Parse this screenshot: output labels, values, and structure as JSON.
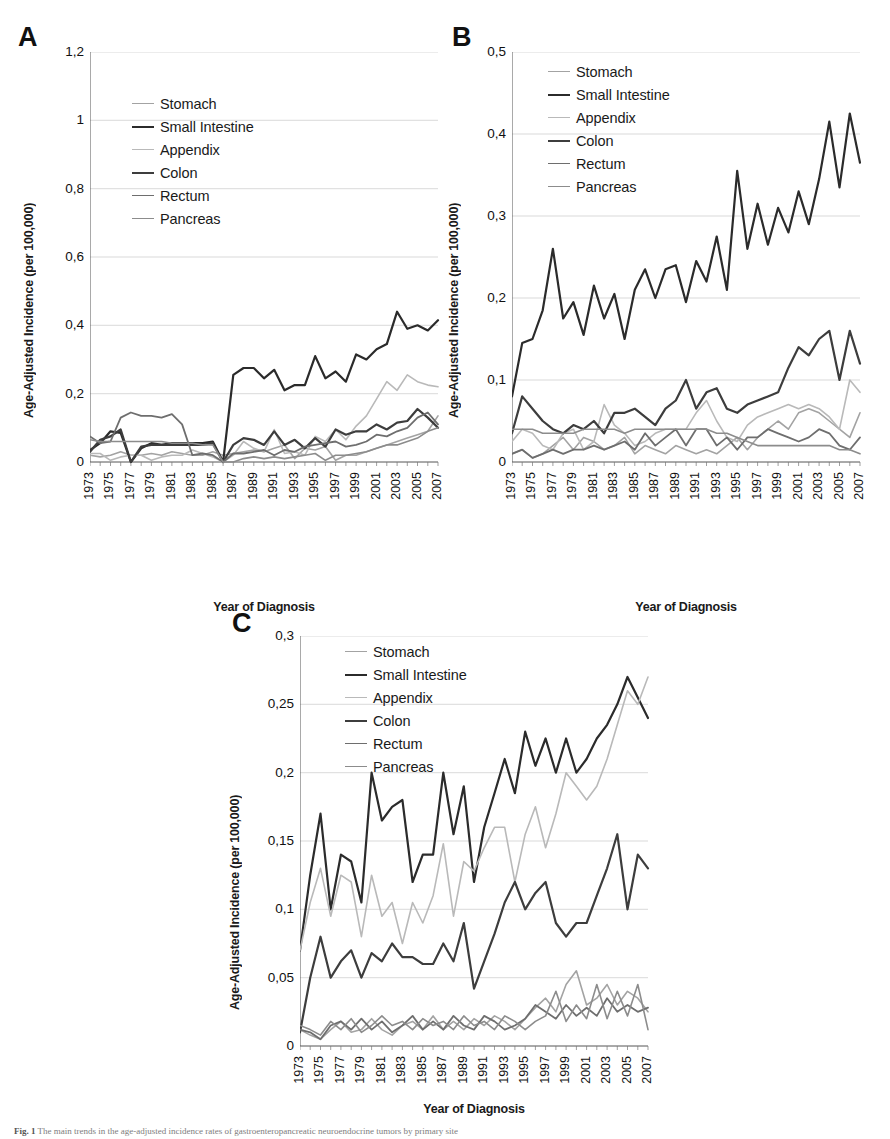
{
  "figure": {
    "caption_prefix": "Fig. 1",
    "caption_text": "The main trends in the age-adjusted incidence rates of gastroenteropancreatic neuroendocrine tumors by primary site"
  },
  "axis": {
    "ylabel": "Age-Adjusted Incidence (per 100,000)",
    "xlabel": "Year of Diagnosis"
  },
  "series_names": [
    "Stomach",
    "Small Intestine",
    "Appendix",
    "Colon",
    "Rectum",
    "Pancreas"
  ],
  "series_colors": [
    "#a3a3a3",
    "#2b2b2b",
    "#b9b9b9",
    "#3d3d3d",
    "#6e6e6e",
    "#8c8c8c"
  ],
  "series_widths": [
    1.6,
    2.2,
    1.6,
    2.2,
    1.8,
    1.6
  ],
  "panels": [
    {
      "letter": "A"
    },
    {
      "letter": "B"
    },
    {
      "letter": "C"
    }
  ],
  "chart_data": [
    {
      "type": "line",
      "panel": "A",
      "title": "",
      "xlabel": "Year of Diagnosis",
      "ylabel": "Age-Adjusted Incidence (per 100,000)",
      "xlim": [
        1973,
        2007
      ],
      "ylim": [
        0,
        1.2
      ],
      "yticks": [
        0,
        0.2,
        0.4,
        0.6,
        0.8,
        1,
        1.2
      ],
      "ytick_labels": [
        "0",
        "0,2",
        "0,4",
        "0,6",
        "0,8",
        "1",
        "1,2"
      ],
      "x": [
        1973,
        1974,
        1975,
        1976,
        1977,
        1978,
        1979,
        1980,
        1981,
        1982,
        1983,
        1984,
        1985,
        1986,
        1987,
        1988,
        1989,
        1990,
        1991,
        1992,
        1993,
        1994,
        1995,
        1996,
        1997,
        1998,
        1999,
        2000,
        2001,
        2002,
        2003,
        2004,
        2005,
        2006,
        2007
      ],
      "xtick_labels": [
        "1973",
        "1975",
        "1977",
        "1979",
        "1981",
        "1983",
        "1985",
        "1987",
        "1989",
        "1991",
        "1993",
        "1995",
        "1997",
        "1999",
        "2001",
        "2003",
        "2005",
        "2007"
      ],
      "grid": true,
      "legend_position": "upper-left",
      "series": [
        {
          "name": "Stomach",
          "values": [
            0.02,
            0.015,
            0.02,
            0.03,
            0.02,
            0.02,
            0.025,
            0.02,
            0.03,
            0.025,
            0.02,
            0.02,
            0.03,
            0.02,
            0.025,
            0.03,
            0.035,
            0.03,
            0.04,
            0.05,
            0.01,
            0.04,
            0.035,
            0.045,
            0.005,
            0.02,
            0.02,
            0.03,
            0.04,
            0.05,
            0.06,
            0.07,
            0.08,
            0.09,
            0.135
          ]
        },
        {
          "name": "Small Intestine",
          "values": [
            0.035,
            0.055,
            0.09,
            0.085,
            0.0,
            0.04,
            0.055,
            0.05,
            0.055,
            0.055,
            0.055,
            0.055,
            0.06,
            0.0,
            0.255,
            0.275,
            0.275,
            0.245,
            0.27,
            0.21,
            0.225,
            0.225,
            0.31,
            0.245,
            0.265,
            0.235,
            0.315,
            0.3,
            0.33,
            0.345,
            0.44,
            0.39,
            0.4,
            0.385,
            0.415
          ]
        },
        {
          "name": "Appendix",
          "values": [
            0.025,
            0.025,
            0.005,
            0.015,
            0.02,
            0.02,
            0.005,
            0.015,
            0.02,
            0.02,
            0.035,
            0.025,
            0.015,
            0.0,
            0.02,
            0.06,
            0.04,
            0.03,
            0.095,
            0.025,
            0.03,
            0.02,
            0.075,
            0.06,
            0.095,
            0.065,
            0.105,
            0.135,
            0.185,
            0.235,
            0.21,
            0.255,
            0.235,
            0.225,
            0.22
          ]
        },
        {
          "name": "Colon",
          "values": [
            0.03,
            0.065,
            0.075,
            0.095,
            0.0,
            0.045,
            0.05,
            0.05,
            0.05,
            0.05,
            0.05,
            0.05,
            0.055,
            0.0,
            0.05,
            0.07,
            0.065,
            0.05,
            0.09,
            0.05,
            0.065,
            0.04,
            0.07,
            0.045,
            0.095,
            0.08,
            0.09,
            0.09,
            0.11,
            0.095,
            0.115,
            0.12,
            0.155,
            0.13,
            0.1
          ]
        },
        {
          "name": "Rectum",
          "values": [
            0.075,
            0.055,
            0.06,
            0.13,
            0.145,
            0.135,
            0.135,
            0.13,
            0.14,
            0.11,
            0.02,
            0.025,
            0.02,
            0.0,
            0.025,
            0.025,
            0.03,
            0.035,
            0.02,
            0.035,
            0.03,
            0.045,
            0.05,
            0.055,
            0.06,
            0.045,
            0.05,
            0.06,
            0.08,
            0.075,
            0.09,
            0.1,
            0.13,
            0.145,
            0.11
          ]
        },
        {
          "name": "Pancreas",
          "values": [
            0.065,
            0.06,
            0.06,
            0.06,
            0.06,
            0.06,
            0.06,
            0.06,
            0.055,
            0.055,
            0.055,
            0.05,
            0.05,
            0.0,
            0.0,
            0.01,
            0.015,
            0.01,
            0.015,
            0.01,
            0.015,
            0.02,
            0.025,
            0.005,
            0.02,
            0.02,
            0.025,
            0.03,
            0.04,
            0.05,
            0.05,
            0.06,
            0.07,
            0.09,
            0.1
          ]
        }
      ]
    },
    {
      "type": "line",
      "panel": "B",
      "title": "",
      "xlabel": "Year of Diagnosis",
      "ylabel": "Age-Adjusted Incidence (per 100,000)",
      "xlim": [
        1973,
        2007
      ],
      "ylim": [
        0,
        0.5
      ],
      "yticks": [
        0,
        0.1,
        0.2,
        0.3,
        0.4,
        0.5
      ],
      "ytick_labels": [
        "0",
        "0,1",
        "0,2",
        "0,3",
        "0,4",
        "0,5"
      ],
      "x": [
        1973,
        1974,
        1975,
        1976,
        1977,
        1978,
        1979,
        1980,
        1981,
        1982,
        1983,
        1984,
        1985,
        1986,
        1987,
        1988,
        1989,
        1990,
        1991,
        1992,
        1993,
        1994,
        1995,
        1996,
        1997,
        1998,
        1999,
        2000,
        2001,
        2002,
        2003,
        2004,
        2005,
        2006,
        2007
      ],
      "xtick_labels": [
        "1973",
        "1975",
        "1977",
        "1979",
        "1981",
        "1983",
        "1985",
        "1987",
        "1989",
        "1991",
        "1993",
        "1995",
        "1997",
        "1999",
        "2001",
        "2003",
        "2005",
        "2007"
      ],
      "grid": true,
      "legend_position": "upper-left",
      "series": [
        {
          "name": "Stomach",
          "values": [
            0.01,
            0.015,
            0.005,
            0.01,
            0.02,
            0.03,
            0.015,
            0.03,
            0.025,
            0.015,
            0.02,
            0.03,
            0.01,
            0.02,
            0.015,
            0.01,
            0.02,
            0.015,
            0.01,
            0.015,
            0.01,
            0.02,
            0.03,
            0.015,
            0.03,
            0.04,
            0.05,
            0.04,
            0.06,
            0.065,
            0.06,
            0.05,
            0.04,
            0.03,
            0.06
          ]
        },
        {
          "name": "Small Intestine",
          "values": [
            0.08,
            0.145,
            0.15,
            0.185,
            0.26,
            0.175,
            0.195,
            0.155,
            0.215,
            0.175,
            0.205,
            0.15,
            0.21,
            0.235,
            0.2,
            0.235,
            0.24,
            0.195,
            0.245,
            0.22,
            0.275,
            0.21,
            0.355,
            0.26,
            0.315,
            0.265,
            0.31,
            0.28,
            0.33,
            0.29,
            0.345,
            0.415,
            0.335,
            0.425,
            0.365
          ]
        },
        {
          "name": "Appendix",
          "values": [
            0.025,
            0.04,
            0.035,
            0.02,
            0.015,
            0.035,
            0.04,
            0.015,
            0.025,
            0.07,
            0.045,
            0.035,
            0.02,
            0.025,
            0.035,
            0.04,
            0.04,
            0.04,
            0.06,
            0.075,
            0.05,
            0.03,
            0.025,
            0.045,
            0.055,
            0.06,
            0.065,
            0.07,
            0.065,
            0.07,
            0.065,
            0.055,
            0.04,
            0.1,
            0.085
          ]
        },
        {
          "name": "Colon",
          "values": [
            0.035,
            0.08,
            0.065,
            0.05,
            0.04,
            0.035,
            0.045,
            0.04,
            0.05,
            0.035,
            0.06,
            0.06,
            0.065,
            0.055,
            0.045,
            0.065,
            0.075,
            0.1,
            0.065,
            0.085,
            0.09,
            0.065,
            0.06,
            0.07,
            0.075,
            0.08,
            0.085,
            0.115,
            0.14,
            0.13,
            0.15,
            0.16,
            0.1,
            0.16,
            0.12
          ]
        },
        {
          "name": "Rectum",
          "values": [
            0.01,
            0.015,
            0.005,
            0.01,
            0.015,
            0.01,
            0.015,
            0.015,
            0.02,
            0.015,
            0.02,
            0.025,
            0.015,
            0.035,
            0.02,
            0.03,
            0.04,
            0.02,
            0.04,
            0.04,
            0.02,
            0.03,
            0.015,
            0.03,
            0.03,
            0.04,
            0.035,
            0.03,
            0.025,
            0.03,
            0.04,
            0.035,
            0.02,
            0.015,
            0.03
          ]
        },
        {
          "name": "Pancreas",
          "values": [
            0.04,
            0.04,
            0.04,
            0.035,
            0.035,
            0.035,
            0.035,
            0.04,
            0.04,
            0.04,
            0.04,
            0.035,
            0.04,
            0.04,
            0.04,
            0.04,
            0.04,
            0.04,
            0.04,
            0.04,
            0.035,
            0.035,
            0.03,
            0.025,
            0.02,
            0.02,
            0.02,
            0.02,
            0.02,
            0.02,
            0.02,
            0.02,
            0.015,
            0.015,
            0.01
          ]
        }
      ]
    },
    {
      "type": "line",
      "panel": "C",
      "title": "",
      "xlabel": "Year of Diagnosis",
      "ylabel": "Age-Adjusted Incidence (per 100,000)",
      "xlim": [
        1973,
        2007
      ],
      "ylim": [
        0,
        0.3
      ],
      "yticks": [
        0,
        0.05,
        0.1,
        0.15,
        0.2,
        0.25,
        0.3
      ],
      "ytick_labels": [
        "0",
        "0,05",
        "0,1",
        "0,15",
        "0,2",
        "0,25",
        "0,3"
      ],
      "x": [
        1973,
        1974,
        1975,
        1976,
        1977,
        1978,
        1979,
        1980,
        1981,
        1982,
        1983,
        1984,
        1985,
        1986,
        1987,
        1988,
        1989,
        1990,
        1991,
        1992,
        1993,
        1994,
        1995,
        1996,
        1997,
        1998,
        1999,
        2000,
        2001,
        2002,
        2003,
        2004,
        2005,
        2006,
        2007
      ],
      "xtick_labels": [
        "1973",
        "1975",
        "1977",
        "1979",
        "1981",
        "1983",
        "1985",
        "1987",
        "1989",
        "1991",
        "1993",
        "1995",
        "1997",
        "1999",
        "2001",
        "2003",
        "2005",
        "2007"
      ],
      "grid": true,
      "legend_position": "upper-center",
      "series": [
        {
          "name": "Stomach",
          "values": [
            0.012,
            0.008,
            0.005,
            0.012,
            0.018,
            0.01,
            0.012,
            0.02,
            0.012,
            0.008,
            0.015,
            0.018,
            0.012,
            0.022,
            0.012,
            0.018,
            0.012,
            0.02,
            0.015,
            0.022,
            0.018,
            0.012,
            0.02,
            0.028,
            0.035,
            0.025,
            0.045,
            0.055,
            0.03,
            0.035,
            0.045,
            0.03,
            0.04,
            0.035,
            0.025
          ]
        },
        {
          "name": "Small Intestine",
          "values": [
            0.07,
            0.125,
            0.17,
            0.1,
            0.14,
            0.135,
            0.105,
            0.2,
            0.165,
            0.175,
            0.18,
            0.12,
            0.14,
            0.14,
            0.2,
            0.155,
            0.19,
            0.12,
            0.16,
            0.185,
            0.21,
            0.185,
            0.23,
            0.205,
            0.225,
            0.2,
            0.225,
            0.2,
            0.21,
            0.225,
            0.235,
            0.25,
            0.27,
            0.255,
            0.24
          ]
        },
        {
          "name": "Appendix",
          "values": [
            0.07,
            0.105,
            0.13,
            0.095,
            0.125,
            0.12,
            0.08,
            0.125,
            0.095,
            0.105,
            0.075,
            0.105,
            0.09,
            0.11,
            0.148,
            0.095,
            0.135,
            0.128,
            0.145,
            0.16,
            0.16,
            0.12,
            0.155,
            0.175,
            0.145,
            0.17,
            0.2,
            0.19,
            0.18,
            0.19,
            0.21,
            0.235,
            0.26,
            0.25,
            0.27
          ]
        },
        {
          "name": "Colon",
          "values": [
            0.01,
            0.05,
            0.08,
            0.05,
            0.062,
            0.07,
            0.05,
            0.068,
            0.062,
            0.075,
            0.065,
            0.065,
            0.06,
            0.06,
            0.075,
            0.062,
            0.09,
            0.042,
            0.062,
            0.082,
            0.105,
            0.12,
            0.1,
            0.112,
            0.12,
            0.09,
            0.08,
            0.09,
            0.09,
            0.11,
            0.13,
            0.155,
            0.1,
            0.14,
            0.13
          ]
        },
        {
          "name": "Rectum",
          "values": [
            0.012,
            0.01,
            0.005,
            0.015,
            0.018,
            0.012,
            0.02,
            0.012,
            0.018,
            0.01,
            0.015,
            0.022,
            0.012,
            0.018,
            0.012,
            0.022,
            0.015,
            0.012,
            0.022,
            0.018,
            0.012,
            0.015,
            0.02,
            0.03,
            0.025,
            0.02,
            0.03,
            0.022,
            0.028,
            0.022,
            0.035,
            0.025,
            0.03,
            0.025,
            0.028
          ]
        },
        {
          "name": "Pancreas",
          "values": [
            0.015,
            0.012,
            0.008,
            0.018,
            0.012,
            0.02,
            0.01,
            0.015,
            0.022,
            0.015,
            0.018,
            0.012,
            0.02,
            0.015,
            0.018,
            0.012,
            0.022,
            0.015,
            0.018,
            0.012,
            0.022,
            0.018,
            0.012,
            0.018,
            0.022,
            0.04,
            0.018,
            0.03,
            0.02,
            0.045,
            0.02,
            0.04,
            0.022,
            0.045,
            0.012
          ]
        }
      ]
    }
  ]
}
